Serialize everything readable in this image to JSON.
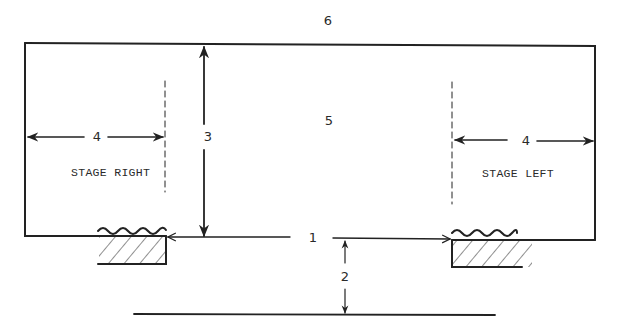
{
  "diagram": {
    "type": "stage-plan",
    "labels": {
      "offstage_back": "6",
      "stage_area": "5",
      "depth": "3",
      "wing_width_left": "4",
      "wing_width_right": "4",
      "proscenium_width": "1",
      "apron_depth": "2",
      "stage_right": "STAGE RIGHT",
      "stage_left": "STAGE LEFT"
    },
    "colors": {
      "ink": "#222222",
      "background": "#ffffff"
    }
  }
}
